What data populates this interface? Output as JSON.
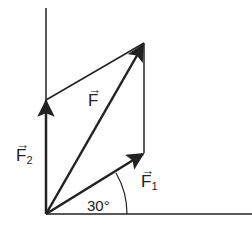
{
  "diagram": {
    "type": "vector-parallelogram",
    "colors": {
      "line": "#222222",
      "background": "#ffffff"
    },
    "origin": [
      46,
      214
    ],
    "vectors": [
      {
        "id": "F1",
        "label": "F",
        "subscript": "1",
        "arrow": "→",
        "tip": [
          144,
          153
        ]
      },
      {
        "id": "F2",
        "label": "F",
        "subscript": "2",
        "arrow": "→",
        "tip": [
          46,
          100
        ]
      },
      {
        "id": "F",
        "label": "F",
        "subscript": "",
        "arrow": "→",
        "tip": [
          144,
          43
        ]
      }
    ],
    "angle": {
      "label": "30°",
      "between": [
        "x-axis",
        "F1"
      ]
    }
  }
}
